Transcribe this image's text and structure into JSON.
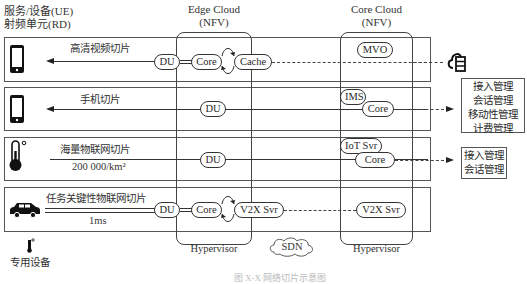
{
  "headers": {
    "ue_line1": "服务/设备(UE)",
    "ue_line2": "射频单元(RD)",
    "edge_cloud": "Edge Cloud",
    "edge_nfv": "(NFV)",
    "core_cloud": "Core Cloud",
    "core_nfv": "(NFV)"
  },
  "slices": [
    {
      "device_icon": "smartphone-icon",
      "name": "高清视频切片",
      "du": "DU",
      "edge_nodes": [
        "Core",
        "Cache"
      ],
      "core_nodes": [
        "MVO"
      ],
      "target": "cloud-server-icon"
    },
    {
      "device_icon": "smartphone-icon",
      "name": "手机切片",
      "du": "DU",
      "edge_nodes": [],
      "core_nodes": [
        "IMS",
        "Core"
      ],
      "target_functions": [
        "接入管理",
        "会话管理",
        "移动性管理",
        "计费管理"
      ]
    },
    {
      "device_icon": "thermometer-icon",
      "name": "海量物联网切片",
      "metric": "200 000/km²",
      "du": "DU",
      "edge_nodes": [],
      "core_nodes": [
        "IoT Svr",
        "Core"
      ],
      "target_functions": [
        "接入管理",
        "会话管理"
      ]
    },
    {
      "device_icon": "car-icon",
      "name": "任务关键性物联网切片",
      "metric": "1ms",
      "du": "DU",
      "edge_nodes": [
        "Core",
        "V2X Svr"
      ],
      "core_nodes": [
        "V2X Svr"
      ]
    }
  ],
  "footer": {
    "special_device": "专用设备",
    "edge_hypervisor": "Hypervisor",
    "sdn": "SDN",
    "core_hypervisor": "Hypervisor",
    "caption": "图 X-X 网络切片示意图"
  },
  "colors": {
    "line": "#333333",
    "text": "#333333",
    "background": "#ffffff"
  }
}
